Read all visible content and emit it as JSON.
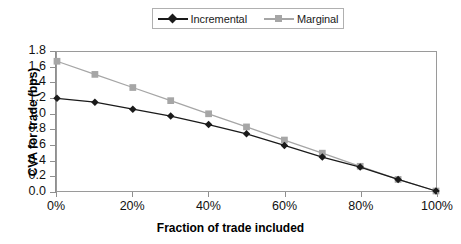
{
  "chart_data": {
    "type": "line",
    "title": "",
    "xlabel": "Fraction of trade included",
    "ylabel": "CVA for trade (bps)",
    "x": [
      0,
      10,
      20,
      30,
      40,
      50,
      60,
      70,
      80,
      90,
      100
    ],
    "x_tick_labels": [
      "0%",
      "20%",
      "40%",
      "60%",
      "80%",
      "100%"
    ],
    "x_tick_values": [
      0,
      20,
      40,
      60,
      80,
      100
    ],
    "xlim": [
      0,
      100
    ],
    "y_tick_labels": [
      "1.8",
      "1.6",
      "1.4",
      "1.2",
      "1.0",
      "0.8",
      "0.6",
      "0.4",
      "0.2",
      "0.0"
    ],
    "y_tick_values": [
      1.8,
      1.6,
      1.4,
      1.2,
      1.0,
      0.8,
      0.6,
      0.4,
      0.2,
      0.0
    ],
    "ylim": [
      0.0,
      1.8
    ],
    "grid": false,
    "legend_position": "top-center",
    "series": [
      {
        "name": "Incremental",
        "color": "#1a1a1a",
        "marker": "diamond",
        "values": [
          1.2,
          1.15,
          1.06,
          0.97,
          0.86,
          0.74,
          0.59,
          0.44,
          0.31,
          0.15,
          0.0
        ]
      },
      {
        "name": "Marginal",
        "color": "#a6a6a6",
        "marker": "square",
        "values": [
          1.68,
          1.51,
          1.34,
          1.17,
          1.0,
          0.83,
          0.66,
          0.49,
          0.32,
          0.15,
          0.0
        ]
      }
    ]
  },
  "legend": {
    "entries": [
      {
        "label": "Incremental"
      },
      {
        "label": "Marginal"
      }
    ]
  },
  "axes": {
    "y_title": "CVA for trade (bps)",
    "x_title": "Fraction of trade included"
  },
  "colors": {
    "incremental": "#1a1a1a",
    "marginal": "#a6a6a6",
    "axis": "#8f8f8f",
    "frame": "#9a9a9a",
    "background": "#ffffff"
  }
}
